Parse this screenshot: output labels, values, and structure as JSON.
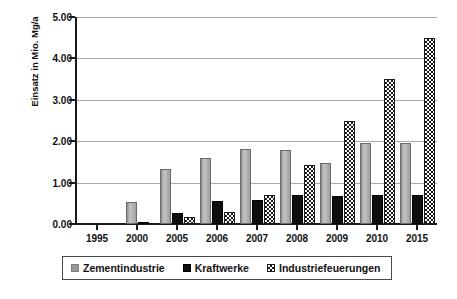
{
  "chart_data": {
    "type": "bar",
    "title": "",
    "subtitle": "",
    "xlabel": "",
    "ylabel": "Einsatz in Mio. Mg/a",
    "categories": [
      "1995",
      "2000",
      "2005",
      "2006",
      "2007",
      "2008",
      "2009",
      "2010",
      "2015"
    ],
    "series": [
      {
        "name": "Zementindustrie",
        "color": "#a8a8a8",
        "pattern": "solid-gray",
        "values": [
          0.0,
          0.53,
          1.32,
          1.6,
          1.8,
          1.79,
          1.47,
          1.95,
          1.95
        ]
      },
      {
        "name": "Kraftwerke",
        "color": "#111111",
        "pattern": "solid-black",
        "values": [
          0.0,
          0.02,
          0.26,
          0.56,
          0.57,
          0.7,
          0.67,
          0.7,
          0.7
        ]
      },
      {
        "name": "Industriefeuerungen",
        "color": "#1b1b1b",
        "pattern": "checkerboard",
        "values": [
          0.0,
          0.0,
          0.17,
          0.3,
          0.7,
          1.43,
          2.5,
          3.5,
          4.5
        ]
      }
    ],
    "ylim": [
      0.0,
      5.0
    ],
    "yticks": [
      "0.00",
      "1.00",
      "2.00",
      "3.00",
      "4.00",
      "5.00"
    ],
    "ytick_values": [
      0,
      1,
      2,
      3,
      4,
      5
    ],
    "grid": "horizontal",
    "legend_position": "bottom"
  },
  "legend": {
    "items": [
      {
        "label": "Zementindustrie",
        "swatch": "gray-square-icon"
      },
      {
        "label": "Kraftwerke",
        "swatch": "black-square-icon"
      },
      {
        "label": "Industriefeuerungen",
        "swatch": "checkered-square-icon"
      }
    ]
  }
}
